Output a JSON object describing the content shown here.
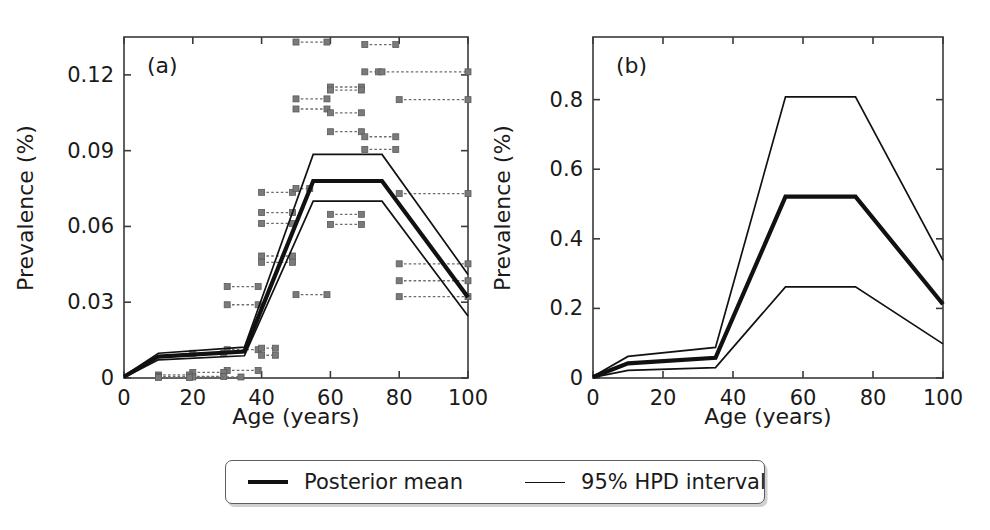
{
  "figure": {
    "background_color": "#ffffff",
    "line_color": "#111111",
    "data_color": "#7a7a7a",
    "axis_color": "#3a3a3a"
  },
  "legend": {
    "entries": [
      {
        "label": "Posterior mean",
        "style": "thick",
        "icon": "line-thick-icon"
      },
      {
        "label": "95% HPD interval",
        "style": "thin",
        "icon": "line-thin-icon"
      }
    ]
  },
  "chart_data": [
    {
      "type": "line",
      "panel": "a",
      "tag": "(a)",
      "title": "",
      "xlabel": "Age (years)",
      "ylabel": "Prevalence (%)",
      "xlim": [
        0,
        100
      ],
      "ylim": [
        0,
        0.135
      ],
      "xticks": [
        0,
        20,
        40,
        60,
        80,
        100
      ],
      "xticklabels": [
        "0",
        "20",
        "40",
        "60",
        "80",
        "100"
      ],
      "yticks": [
        0,
        0.03,
        0.06,
        0.09,
        0.12
      ],
      "yticklabels": [
        "0",
        "0.03",
        "0.06",
        "0.09",
        "0.12"
      ],
      "grid": false,
      "legend_position": "below-figure",
      "x": [
        0,
        10,
        35,
        55,
        75,
        100
      ],
      "series": [
        {
          "name": "Posterior mean",
          "style": "thick",
          "values": [
            0.0005,
            0.0085,
            0.0105,
            0.078,
            0.078,
            0.032
          ]
        },
        {
          "name": "95% HPD upper",
          "style": "thin",
          "values": [
            0.0008,
            0.0098,
            0.0122,
            0.0885,
            0.0885,
            0.041
          ]
        },
        {
          "name": "95% HPD lower",
          "style": "thin",
          "values": [
            0.0002,
            0.0072,
            0.0088,
            0.07,
            0.07,
            0.0245
          ]
        }
      ],
      "observations": [
        {
          "x0": 50,
          "x1": 59,
          "y": 0.133
        },
        {
          "x0": 70,
          "x1": 79,
          "y": 0.132
        },
        {
          "x0": 70,
          "x1": 74,
          "y": 0.1212
        },
        {
          "x0": 75,
          "x1": 100,
          "y": 0.1212
        },
        {
          "x0": 60,
          "x1": 69,
          "y": 0.1152
        },
        {
          "x0": 60,
          "x1": 69,
          "y": 0.114
        },
        {
          "x0": 50,
          "x1": 59,
          "y": 0.1105
        },
        {
          "x0": 80,
          "x1": 100,
          "y": 0.1102
        },
        {
          "x0": 50,
          "x1": 59,
          "y": 0.1065
        },
        {
          "x0": 60,
          "x1": 69,
          "y": 0.105
        },
        {
          "x0": 60,
          "x1": 69,
          "y": 0.0975
        },
        {
          "x0": 70,
          "x1": 79,
          "y": 0.0955
        },
        {
          "x0": 70,
          "x1": 79,
          "y": 0.0905
        },
        {
          "x0": 40,
          "x1": 49,
          "y": 0.0735
        },
        {
          "x0": 50,
          "x1": 54,
          "y": 0.075
        },
        {
          "x0": 80,
          "x1": 100,
          "y": 0.073
        },
        {
          "x0": 40,
          "x1": 49,
          "y": 0.0655
        },
        {
          "x0": 60,
          "x1": 69,
          "y": 0.0648
        },
        {
          "x0": 40,
          "x1": 49,
          "y": 0.0612
        },
        {
          "x0": 60,
          "x1": 69,
          "y": 0.0608
        },
        {
          "x0": 40,
          "x1": 49,
          "y": 0.0483
        },
        {
          "x0": 40,
          "x1": 49,
          "y": 0.0458
        },
        {
          "x0": 30,
          "x1": 39,
          "y": 0.0362
        },
        {
          "x0": 50,
          "x1": 59,
          "y": 0.033
        },
        {
          "x0": 30,
          "x1": 39,
          "y": 0.029
        },
        {
          "x0": 80,
          "x1": 100,
          "y": 0.0452
        },
        {
          "x0": 80,
          "x1": 100,
          "y": 0.0385
        },
        {
          "x0": 80,
          "x1": 100,
          "y": 0.0322
        },
        {
          "x0": 20,
          "x1": 29,
          "y": 0.0098
        },
        {
          "x0": 30,
          "x1": 39,
          "y": 0.0112
        },
        {
          "x0": 40,
          "x1": 44,
          "y": 0.0118
        },
        {
          "x0": 40,
          "x1": 44,
          "y": 0.009
        },
        {
          "x0": 30,
          "x1": 39,
          "y": 0.003
        },
        {
          "x0": 20,
          "x1": 29,
          "y": 0.0022
        },
        {
          "x0": 10,
          "x1": 19,
          "y": 0.0012
        },
        {
          "x0": 10,
          "x1": 29,
          "y": 0.0006
        },
        {
          "x0": 20,
          "x1": 34,
          "y": 0.0004
        },
        {
          "x0": 10,
          "x1": 19,
          "y": 0.0002
        }
      ]
    },
    {
      "type": "line",
      "panel": "b",
      "tag": "(b)",
      "title": "",
      "xlabel": "Age (years)",
      "ylabel": "Prevalence (%)",
      "xlim": [
        0,
        100
      ],
      "ylim": [
        0,
        0.98
      ],
      "xticks": [
        0,
        20,
        40,
        60,
        80,
        100
      ],
      "xticklabels": [
        "0",
        "20",
        "40",
        "60",
        "80",
        "100"
      ],
      "yticks": [
        0,
        0.2,
        0.4,
        0.6,
        0.8
      ],
      "yticklabels": [
        "0",
        "0.2",
        "0.4",
        "0.6",
        "0.8"
      ],
      "grid": false,
      "legend_position": "below-figure",
      "x": [
        0,
        10,
        35,
        55,
        75,
        100
      ],
      "series": [
        {
          "name": "Posterior mean",
          "style": "thick",
          "values": [
            0.003,
            0.042,
            0.058,
            0.521,
            0.521,
            0.212
          ]
        },
        {
          "name": "95% HPD upper",
          "style": "thin",
          "values": [
            0.004,
            0.062,
            0.088,
            0.808,
            0.808,
            0.338
          ]
        },
        {
          "name": "95% HPD lower",
          "style": "thin",
          "values": [
            0.002,
            0.022,
            0.03,
            0.262,
            0.262,
            0.098
          ]
        }
      ],
      "observations": []
    }
  ]
}
